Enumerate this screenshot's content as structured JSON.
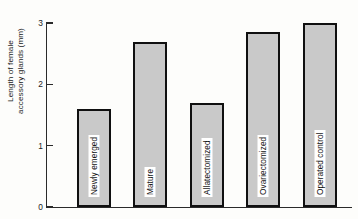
{
  "chart_data": {
    "type": "bar",
    "title": "",
    "xlabel": "",
    "ylabel": "Length of female accessory glands (mm)",
    "ylabel_lines": [
      "Length of female",
      "accessory glands (mm)"
    ],
    "categories": [
      "Newly emerged",
      "Mature",
      "Allatectomized",
      "Ovariectomized",
      "Operated control"
    ],
    "values": [
      1.6,
      2.7,
      1.7,
      2.85,
      3.0
    ],
    "ylim": [
      0,
      3.1
    ],
    "yticks": [
      0,
      1,
      2,
      3
    ],
    "ytick_labels": [
      "0",
      "1",
      "2",
      "3"
    ],
    "grid": false,
    "legend": false,
    "bar_fill_color": "#c9c9c9",
    "bar_border_color": "#101010",
    "background_color": "#fdfdfb"
  }
}
